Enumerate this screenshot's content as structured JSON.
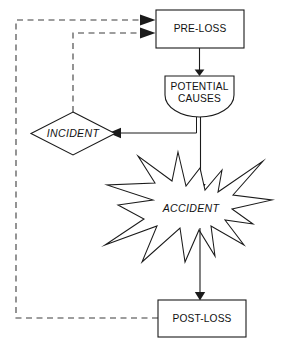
{
  "diagram": {
    "colors": {
      "stroke": "#1a1a1a",
      "dashed_stroke": "#3c3c3c",
      "fill": "#ffffff",
      "text": "#111111"
    },
    "nodes": [
      {
        "id": "pre-loss",
        "label": "PRE-LOSS",
        "shape": "rectangle",
        "style": "upright"
      },
      {
        "id": "potential-causes",
        "label_line1": "POTENTIAL",
        "label_line2": "CAUSES",
        "shape": "shield",
        "style": "upright"
      },
      {
        "id": "incident",
        "label": "INCIDENT",
        "shape": "diamond",
        "style": "italic"
      },
      {
        "id": "accident",
        "label": "ACCIDENT",
        "shape": "starburst",
        "style": "italic"
      },
      {
        "id": "post-loss",
        "label": "POST-LOSS",
        "shape": "rectangle",
        "style": "upright"
      }
    ],
    "edges": [
      {
        "id": "pre-loss-to-potential-causes",
        "from": "pre-loss",
        "to": "potential-causes",
        "line": "solid",
        "arrow": true
      },
      {
        "id": "potential-causes-to-incident",
        "from": "potential-causes",
        "to": "incident",
        "line": "solid",
        "arrow": true
      },
      {
        "id": "potential-causes-to-accident",
        "from": "potential-causes",
        "to": "accident",
        "line": "solid",
        "arrow": true
      },
      {
        "id": "accident-to-post-loss",
        "from": "accident",
        "to": "post-loss",
        "line": "solid",
        "arrow": true
      },
      {
        "id": "incident-to-pre-loss-feedback",
        "from": "incident",
        "to": "pre-loss",
        "line": "dashed",
        "arrow": true
      },
      {
        "id": "post-loss-to-pre-loss-feedback",
        "from": "post-loss",
        "to": "pre-loss",
        "line": "dashed",
        "arrow": true
      }
    ]
  }
}
